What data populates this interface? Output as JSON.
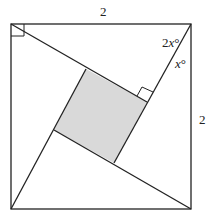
{
  "diagram": {
    "type": "geometry",
    "labels": {
      "top_side": "2",
      "right_side": "2",
      "angle_upper_num": "2",
      "angle_upper_var": "x",
      "angle_lower_var": "x",
      "degree": "°"
    },
    "shapes": {
      "outer": "square",
      "inner": "shaded square",
      "right_angle_marks": 2
    },
    "colors": {
      "line": "#222222",
      "fill": "#d9d9d9"
    }
  }
}
